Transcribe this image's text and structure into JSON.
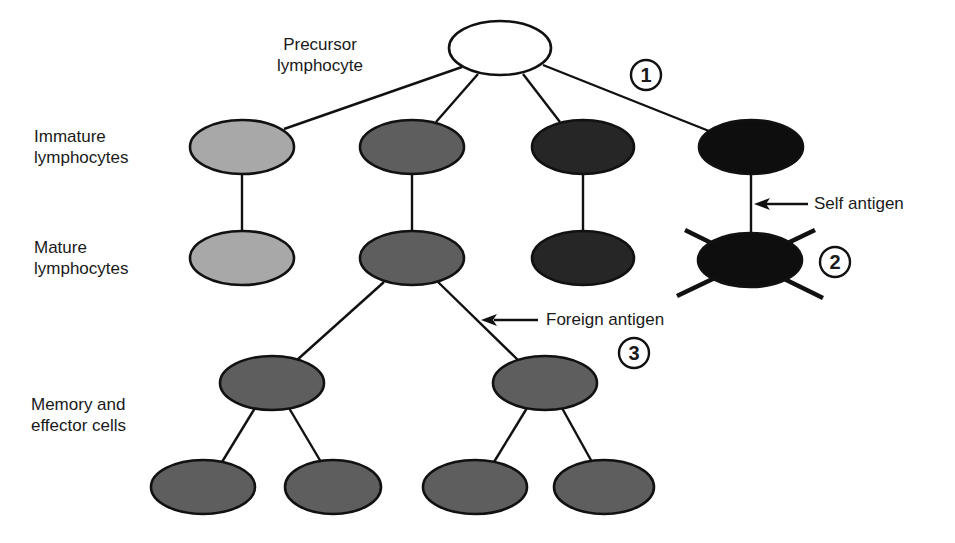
{
  "diagram": {
    "colors": {
      "outline": "#111111",
      "precursor_fill": "#ffffff",
      "clone_light": "#a8a8a8",
      "clone_mid": "#5e5e5e",
      "clone_dark": "#262626",
      "clone_black": "#0e0e0e",
      "background": "#ffffff"
    },
    "row_labels": {
      "precursor": [
        "Precursor",
        "lymphocyte"
      ],
      "immature": [
        "Immature",
        "lymphocytes"
      ],
      "mature": [
        "Mature",
        "lymphocytes"
      ],
      "memory": [
        "Memory and",
        "effector cells"
      ]
    },
    "annotations": {
      "self_antigen": "Self antigen",
      "foreign_antigen": "Foreign antigen",
      "step1": "1",
      "step2": "2",
      "step3": "3"
    },
    "nodes": [
      {
        "id": "precursor",
        "label": "Precursor lymphocyte",
        "cx": 500,
        "cy": 48,
        "fill": "precursor_fill"
      },
      {
        "id": "immature-1",
        "cx": 242,
        "cy": 147,
        "fill": "clone_light"
      },
      {
        "id": "immature-2",
        "cx": 412,
        "cy": 147,
        "fill": "clone_mid"
      },
      {
        "id": "immature-3",
        "cx": 583,
        "cy": 147,
        "fill": "clone_dark"
      },
      {
        "id": "immature-4",
        "cx": 751,
        "cy": 147,
        "fill": "clone_black"
      },
      {
        "id": "mature-1",
        "cx": 242,
        "cy": 258,
        "fill": "clone_light"
      },
      {
        "id": "mature-2",
        "cx": 412,
        "cy": 258,
        "fill": "clone_mid"
      },
      {
        "id": "mature-3",
        "cx": 583,
        "cy": 258,
        "fill": "clone_dark"
      },
      {
        "id": "mature-4-deleted",
        "cx": 750,
        "cy": 260,
        "fill": "clone_black",
        "crossed_out": true
      },
      {
        "id": "memory-1",
        "cx": 272,
        "cy": 383,
        "fill": "clone_mid"
      },
      {
        "id": "memory-2",
        "cx": 545,
        "cy": 383,
        "fill": "clone_mid"
      },
      {
        "id": "effector-1",
        "cx": 203,
        "cy": 487,
        "fill": "clone_mid"
      },
      {
        "id": "effector-2",
        "cx": 333,
        "cy": 487,
        "fill": "clone_mid"
      },
      {
        "id": "effector-3",
        "cx": 475,
        "cy": 487,
        "fill": "clone_mid"
      },
      {
        "id": "effector-4",
        "cx": 604,
        "cy": 487,
        "fill": "clone_mid"
      }
    ]
  }
}
